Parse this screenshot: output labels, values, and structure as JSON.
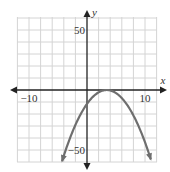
{
  "chart_data": {
    "type": "line",
    "title": "",
    "xlabel": "x",
    "ylabel": "y",
    "xlim": [
      -12,
      12
    ],
    "ylim": [
      -62,
      62
    ],
    "x_grid_step": 2,
    "y_grid_step": 10,
    "grid": true,
    "x_tick_labels": [
      {
        "value": -10,
        "label": "−10"
      },
      {
        "value": 10,
        "label": "10"
      }
    ],
    "y_tick_labels": [
      {
        "value": 50,
        "label": "50"
      },
      {
        "value": -50,
        "label": "−50"
      }
    ],
    "series": [
      {
        "name": "parabola",
        "description": "downward-opening parabola with vertex on the x-axis near x≈3.4, arrows at both ends",
        "vertex": [
          3.4,
          0
        ],
        "x_range": [
          -4.3,
          11
        ],
        "x": [
          -4.3,
          -3,
          -2,
          -1,
          0,
          1,
          2,
          3,
          3.4,
          4,
          5,
          6,
          7,
          8,
          9,
          10,
          11
        ],
        "y": [
          -59.3,
          -41,
          -29.2,
          -19.4,
          -11.6,
          -5.8,
          -2,
          -0.2,
          0,
          -0.4,
          -2.6,
          -6.8,
          -13,
          -21.2,
          -31.4,
          -43.6,
          -57.8
        ],
        "color": "#6e6e6e"
      }
    ]
  },
  "colors": {
    "grid": "#d4d4d4",
    "axis": "#222222",
    "curve": "#6e6e6e",
    "text": "#333333"
  }
}
